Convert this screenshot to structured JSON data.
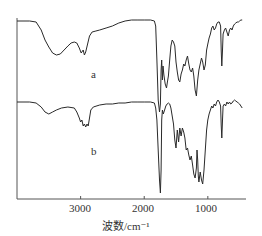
{
  "chart_data": {
    "type": "line",
    "title": "",
    "xlabel": "波数/cm⁻¹",
    "ylabel": "",
    "xlim": [
      4000,
      400
    ],
    "x_reversed": true,
    "grid": false,
    "legend": "inline labels",
    "x_ticks": [
      3000,
      2000,
      1000
    ],
    "x_tick_labels": [
      "3000",
      "2000",
      "1000"
    ],
    "series": [
      {
        "name": "a",
        "label_pos": [
          93,
          78
        ],
        "points": [
          [
            4000,
            21
          ],
          [
            3800,
            21
          ],
          [
            3700,
            22
          ],
          [
            3620,
            30
          ],
          [
            3560,
            40
          ],
          [
            3500,
            47
          ],
          [
            3440,
            53
          ],
          [
            3380,
            55
          ],
          [
            3320,
            54
          ],
          [
            3260,
            50
          ],
          [
            3200,
            46
          ],
          [
            3150,
            43
          ],
          [
            3100,
            42
          ],
          [
            3060,
            43
          ],
          [
            3020,
            48
          ],
          [
            2990,
            53
          ],
          [
            2960,
            50
          ],
          [
            2940,
            55
          ],
          [
            2920,
            52
          ],
          [
            2890,
            44
          ],
          [
            2860,
            36
          ],
          [
            2820,
            32
          ],
          [
            2760,
            31
          ],
          [
            2700,
            30
          ],
          [
            2600,
            28
          ],
          [
            2500,
            26
          ],
          [
            2400,
            23
          ],
          [
            2300,
            21
          ],
          [
            2200,
            20
          ],
          [
            2100,
            20
          ],
          [
            2000,
            20
          ],
          [
            1900,
            20
          ],
          [
            1840,
            21
          ],
          [
            1820,
            26
          ],
          [
            1800,
            60
          ],
          [
            1780,
            100
          ],
          [
            1760,
            112
          ],
          [
            1745,
            104
          ],
          [
            1735,
            70
          ],
          [
            1725,
            60
          ],
          [
            1715,
            80
          ],
          [
            1705,
            66
          ],
          [
            1690,
            75
          ],
          [
            1670,
            84
          ],
          [
            1650,
            88
          ],
          [
            1635,
            82
          ],
          [
            1620,
            76
          ],
          [
            1600,
            60
          ],
          [
            1580,
            46
          ],
          [
            1560,
            40
          ],
          [
            1540,
            42
          ],
          [
            1520,
            46
          ],
          [
            1500,
            62
          ],
          [
            1480,
            72
          ],
          [
            1460,
            80
          ],
          [
            1440,
            82
          ],
          [
            1420,
            74
          ],
          [
            1400,
            70
          ],
          [
            1380,
            64
          ],
          [
            1360,
            66
          ],
          [
            1340,
            60
          ],
          [
            1320,
            56
          ],
          [
            1300,
            64
          ],
          [
            1280,
            70
          ],
          [
            1260,
            72
          ],
          [
            1240,
            68
          ],
          [
            1220,
            76
          ],
          [
            1200,
            90
          ],
          [
            1180,
            96
          ],
          [
            1160,
            80
          ],
          [
            1140,
            70
          ],
          [
            1120,
            64
          ],
          [
            1100,
            58
          ],
          [
            1080,
            62
          ],
          [
            1060,
            70
          ],
          [
            1040,
            65
          ],
          [
            1020,
            50
          ],
          [
            1000,
            44
          ],
          [
            980,
            38
          ],
          [
            960,
            34
          ],
          [
            940,
            28
          ],
          [
            920,
            26
          ],
          [
            900,
            30
          ],
          [
            880,
            28
          ],
          [
            860,
            24
          ],
          [
            840,
            22
          ],
          [
            820,
            22
          ],
          [
            800,
            26
          ],
          [
            790,
            50
          ],
          [
            780,
            66
          ],
          [
            770,
            50
          ],
          [
            760,
            34
          ],
          [
            740,
            30
          ],
          [
            720,
            28
          ],
          [
            700,
            32
          ],
          [
            680,
            36
          ],
          [
            660,
            30
          ],
          [
            640,
            28
          ],
          [
            620,
            30
          ],
          [
            600,
            26
          ],
          [
            580,
            24
          ],
          [
            560,
            23
          ],
          [
            540,
            22
          ],
          [
            520,
            22
          ],
          [
            500,
            21
          ],
          [
            480,
            20
          ],
          [
            460,
            20
          ]
        ]
      },
      {
        "name": "b",
        "label_pos": [
          94,
          155
        ],
        "points": [
          [
            4000,
            102
          ],
          [
            3800,
            102
          ],
          [
            3700,
            103
          ],
          [
            3620,
            107
          ],
          [
            3560,
            112
          ],
          [
            3500,
            114
          ],
          [
            3440,
            112
          ],
          [
            3380,
            110
          ],
          [
            3300,
            108
          ],
          [
            3200,
            107
          ],
          [
            3100,
            108
          ],
          [
            3060,
            112
          ],
          [
            3020,
            118
          ],
          [
            3000,
            122
          ],
          [
            2980,
            120
          ],
          [
            2960,
            126
          ],
          [
            2940,
            124
          ],
          [
            2920,
            127
          ],
          [
            2900,
            124
          ],
          [
            2880,
            126
          ],
          [
            2860,
            118
          ],
          [
            2840,
            110
          ],
          [
            2800,
            107
          ],
          [
            2700,
            105
          ],
          [
            2600,
            104
          ],
          [
            2500,
            104
          ],
          [
            2400,
            103
          ],
          [
            2300,
            103
          ],
          [
            2200,
            102
          ],
          [
            2100,
            102
          ],
          [
            2000,
            102
          ],
          [
            1900,
            102
          ],
          [
            1840,
            103
          ],
          [
            1820,
            108
          ],
          [
            1800,
            120
          ],
          [
            1780,
            150
          ],
          [
            1760,
            180
          ],
          [
            1745,
            193
          ],
          [
            1735,
            170
          ],
          [
            1725,
            120
          ],
          [
            1715,
            110
          ],
          [
            1700,
            114
          ],
          [
            1680,
            110
          ],
          [
            1660,
            106
          ],
          [
            1640,
            104
          ],
          [
            1620,
            103
          ],
          [
            1600,
            104
          ],
          [
            1580,
            108
          ],
          [
            1560,
            116
          ],
          [
            1540,
            124
          ],
          [
            1520,
            140
          ],
          [
            1500,
            148
          ],
          [
            1480,
            130
          ],
          [
            1460,
            142
          ],
          [
            1440,
            128
          ],
          [
            1420,
            136
          ],
          [
            1400,
            128
          ],
          [
            1380,
            132
          ],
          [
            1360,
            138
          ],
          [
            1340,
            150
          ],
          [
            1320,
            148
          ],
          [
            1300,
            155
          ],
          [
            1280,
            160
          ],
          [
            1260,
            156
          ],
          [
            1240,
            165
          ],
          [
            1220,
            174
          ],
          [
            1200,
            178
          ],
          [
            1180,
            168
          ],
          [
            1170,
            150
          ],
          [
            1160,
            160
          ],
          [
            1150,
            176
          ],
          [
            1140,
            182
          ],
          [
            1120,
            172
          ],
          [
            1100,
            180
          ],
          [
            1080,
            184
          ],
          [
            1060,
            170
          ],
          [
            1040,
            150
          ],
          [
            1020,
            130
          ],
          [
            1000,
            120
          ],
          [
            980,
            114
          ],
          [
            960,
            110
          ],
          [
            940,
            106
          ],
          [
            920,
            108
          ],
          [
            900,
            104
          ],
          [
            880,
            106
          ],
          [
            860,
            102
          ],
          [
            840,
            100
          ],
          [
            820,
            102
          ],
          [
            800,
            106
          ],
          [
            790,
            125
          ],
          [
            780,
            138
          ],
          [
            770,
            120
          ],
          [
            760,
            106
          ],
          [
            740,
            104
          ],
          [
            720,
            106
          ],
          [
            700,
            102
          ],
          [
            680,
            104
          ],
          [
            660,
            102
          ],
          [
            640,
            104
          ],
          [
            620,
            103
          ],
          [
            600,
            101
          ],
          [
            580,
            100
          ],
          [
            560,
            101
          ],
          [
            540,
            102
          ],
          [
            520,
            103
          ],
          [
            500,
            104
          ],
          [
            480,
            106
          ],
          [
            460,
            108
          ]
        ]
      }
    ]
  },
  "axes": {
    "x_tick_3000": "3000",
    "x_tick_2000": "2000",
    "x_tick_1000": "1000",
    "xlabel": "波数/cm⁻¹",
    "series_a_label": "a",
    "series_b_label": "b"
  },
  "colors": {
    "line": "#2a2a2a",
    "axis": "#555555"
  }
}
